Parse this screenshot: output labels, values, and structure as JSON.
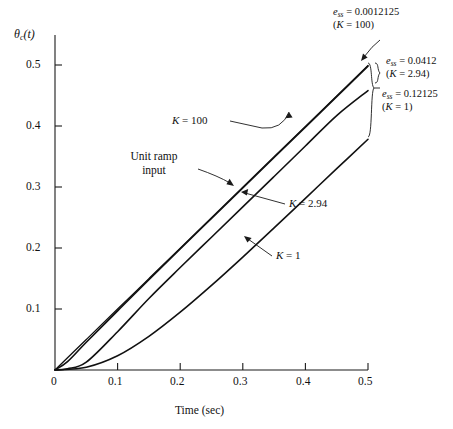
{
  "chart_data": {
    "type": "line",
    "title": "",
    "xlabel": "Time (sec)",
    "ylabel": "θc(t)",
    "xlim": [
      0,
      0.5
    ],
    "ylim": [
      0,
      0.55
    ],
    "xticks": [
      "0",
      "0.1",
      "0.2",
      "0.3",
      "0.4",
      "0.5"
    ],
    "xtick_values": [
      0,
      0.1,
      0.2,
      0.3,
      0.4,
      0.5
    ],
    "yticks": [
      "0.1",
      "0.2",
      "0.3",
      "0.4",
      "0.5"
    ],
    "ytick_values": [
      0.1,
      0.2,
      0.3,
      0.4,
      0.5
    ],
    "grid": false,
    "legend_position": "inline-annotations",
    "series": [
      {
        "name": "Unit ramp input",
        "x": [
          0,
          0.05,
          0.1,
          0.15,
          0.2,
          0.25,
          0.3,
          0.35,
          0.4,
          0.45,
          0.5
        ],
        "values": [
          0,
          0.05,
          0.1,
          0.15,
          0.2,
          0.25,
          0.3,
          0.35,
          0.4,
          0.45,
          0.5
        ]
      },
      {
        "name": "K = 100",
        "x": [
          0,
          0.02,
          0.05,
          0.1,
          0.15,
          0.2,
          0.25,
          0.3,
          0.35,
          0.4,
          0.45,
          0.5
        ],
        "values": [
          0,
          0.0138,
          0.0456,
          0.0971,
          0.1483,
          0.1988,
          0.2488,
          0.2988,
          0.3488,
          0.3988,
          0.4488,
          0.4988
        ]
      },
      {
        "name": "K = 2.94",
        "x": [
          0,
          0.02,
          0.05,
          0.1,
          0.15,
          0.2,
          0.25,
          0.3,
          0.35,
          0.4,
          0.45,
          0.5
        ],
        "values": [
          0,
          0.0021,
          0.0128,
          0.0629,
          0.1174,
          0.1682,
          0.218,
          0.2678,
          0.3177,
          0.3677,
          0.4177,
          0.4588
        ]
      },
      {
        "name": "K = 1",
        "x": [
          0,
          0.05,
          0.1,
          0.15,
          0.2,
          0.25,
          0.3,
          0.35,
          0.4,
          0.45,
          0.5
        ],
        "values": [
          0,
          0.0046,
          0.0234,
          0.0552,
          0.0949,
          0.1389,
          0.1854,
          0.2332,
          0.2818,
          0.3305,
          0.3788
        ]
      }
    ],
    "annotations": [
      {
        "text": "e_ss = 0.0012125 (K = 100)",
        "series": "K = 100"
      },
      {
        "text": "e_ss = 0.0412 (K = 2.94)",
        "series": "K = 2.94"
      },
      {
        "text": "e_ss = 0.12125 (K = 1)",
        "series": "K = 1"
      }
    ]
  },
  "axes": {
    "y_label_theta": "θ",
    "y_label_sub": "c",
    "y_label_tail": "(t)",
    "x_title": "Time (sec)",
    "xticks": [
      "0",
      "0.1",
      "0.2",
      "0.3",
      "0.4",
      "0.5"
    ],
    "yticks": [
      "0.1",
      "0.2",
      "0.3",
      "0.4",
      "0.5"
    ]
  },
  "labels": {
    "k100": {
      "var": "K",
      "eq": " = ",
      "value": "100"
    },
    "k294": {
      "var": "K",
      "eq": " = ",
      "value": "2.94"
    },
    "k1": {
      "var": "K",
      "eq": " = ",
      "value": "1"
    },
    "ramp_line1": "Unit ramp",
    "ramp_line2": "input"
  },
  "annotations": {
    "ess_k100": {
      "var": "e",
      "sub": "ss",
      "eq": " = ",
      "value": "0.0012125",
      "cond": "(K = 100)",
      "cond_var": "K",
      "cond_eq": " = ",
      "cond_value": "100"
    },
    "ess_k294": {
      "var": "e",
      "sub": "ss",
      "eq": " = ",
      "value": "0.0412",
      "cond_var": "K",
      "cond_eq": " = ",
      "cond_value": "2.94"
    },
    "ess_k1": {
      "var": "e",
      "sub": "ss",
      "eq": " = ",
      "value": "0.12125",
      "cond_var": "K",
      "cond_eq": " = ",
      "cond_value": "1"
    }
  },
  "colors": {
    "ink": "#111111",
    "background": "#ffffff"
  }
}
